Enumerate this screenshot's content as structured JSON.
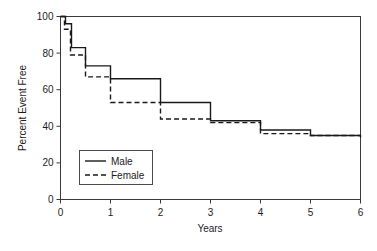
{
  "chart_data": {
    "type": "line",
    "subtype": "kaplan-meier-step",
    "title": "",
    "xlabel": "Years",
    "ylabel": "Percent Event Free",
    "xlim": [
      0,
      6
    ],
    "ylim": [
      0,
      100
    ],
    "xticks": [
      0,
      1,
      2,
      3,
      4,
      5,
      6
    ],
    "xtick_labels": [
      "0",
      "1",
      "2",
      "3",
      "4",
      "5",
      "6"
    ],
    "yticks": [
      0,
      20,
      40,
      60,
      80,
      100
    ],
    "ytick_labels": [
      "0",
      "20",
      "40",
      "60",
      "80",
      "100"
    ],
    "grid": false,
    "legend_position": "lower left",
    "series": [
      {
        "name": "Male",
        "style": "solid",
        "color": "#1a1a1a",
        "x": [
          0.0,
          0.1,
          0.1,
          0.22,
          0.22,
          0.5,
          0.5,
          1.0,
          1.0,
          2.0,
          2.0,
          3.0,
          3.0,
          4.0,
          4.0,
          5.0,
          5.0,
          6.0
        ],
        "y": [
          100,
          100,
          96,
          96,
          83,
          83,
          73,
          73,
          66,
          66,
          53,
          53,
          43,
          43,
          38,
          38,
          35,
          35
        ]
      },
      {
        "name": "Female",
        "style": "dashed",
        "color": "#1a1a1a",
        "x": [
          0.0,
          0.08,
          0.08,
          0.2,
          0.2,
          0.5,
          0.5,
          1.0,
          1.0,
          2.0,
          2.0,
          3.0,
          3.0,
          4.0,
          4.0,
          5.0,
          5.0,
          6.0,
          6.0
        ],
        "y": [
          100,
          100,
          93,
          93,
          79,
          79,
          67,
          67,
          53,
          53,
          44,
          44,
          42,
          42,
          36,
          36,
          35,
          35,
          33
        ]
      }
    ],
    "legend_entries": [
      {
        "label": "Male",
        "style": "solid"
      },
      {
        "label": "Female",
        "style": "dashed"
      }
    ]
  },
  "axes": {
    "x_title": "Years",
    "y_title": "Percent Event Free"
  },
  "legend": {
    "male_label": "Male",
    "female_label": "Female"
  }
}
